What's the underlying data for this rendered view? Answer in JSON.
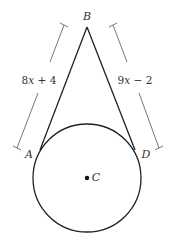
{
  "diagram": {
    "type": "geometry",
    "colors": {
      "stroke": "#222222",
      "dimension_stroke": "#444444",
      "text": "#333333",
      "background": "#ffffff"
    },
    "points": {
      "B": {
        "label": "B"
      },
      "A": {
        "label": "A"
      },
      "D": {
        "label": "D"
      },
      "C": {
        "label": "C"
      }
    },
    "segments": [
      {
        "from": "B",
        "to": "A",
        "length_label": {
          "coef": "8",
          "var": "x",
          "rest": " + 4"
        }
      },
      {
        "from": "B",
        "to": "D",
        "length_label": {
          "coef": "9",
          "var": "x",
          "rest": " − 2"
        }
      }
    ],
    "circle": {
      "center": "C"
    }
  }
}
